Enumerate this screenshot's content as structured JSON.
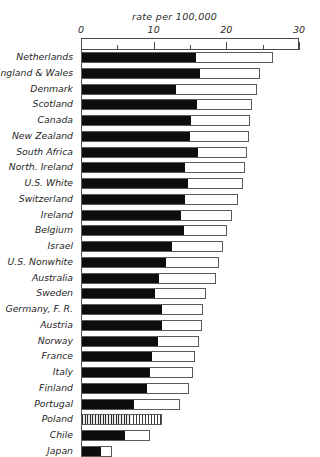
{
  "chart_data": {
    "type": "bar",
    "orientation": "horizontal",
    "title": "rate per 100,000",
    "xlabel": "",
    "ylabel": "",
    "xlim": [
      0,
      30
    ],
    "grid": false,
    "legend": null,
    "tick_labels": [
      "0",
      "10",
      "20",
      "30"
    ],
    "tick_values": [
      0,
      10,
      20,
      30
    ],
    "minor_tick_values": [
      5,
      15,
      25
    ],
    "categories": [
      "Netherlands",
      "England & Wales",
      "Denmark",
      "Scotland",
      "Canada",
      "New Zealand",
      "South Africa",
      "North. Ireland",
      "U.S. White",
      "Switzerland",
      "Ireland",
      "Belgium",
      "Israel",
      "U.S. Nonwhite",
      "Australia",
      "Sweden",
      "Germany, F. R.",
      "Austria",
      "Norway",
      "France",
      "Italy",
      "Finland",
      "Portugal",
      "Poland",
      "Chile",
      "Japan"
    ],
    "series": [
      {
        "name": "dark segment",
        "fill": "solid-black",
        "values": [
          15.7,
          16.3,
          13.0,
          15.8,
          15.0,
          14.9,
          16.0,
          14.2,
          14.6,
          14.2,
          13.6,
          14.1,
          12.4,
          11.6,
          10.6,
          10.1,
          11.0,
          11.0,
          10.5,
          9.6,
          9.3,
          9.0,
          7.2,
          6.8,
          5.9,
          2.6
        ]
      },
      {
        "name": "total (outer bar)",
        "fill": "open-white",
        "values": [
          26.4,
          24.6,
          24.2,
          23.5,
          23.3,
          23.1,
          22.9,
          22.6,
          22.3,
          21.6,
          20.8,
          20.1,
          19.5,
          19.0,
          18.6,
          17.2,
          16.8,
          16.6,
          16.3,
          15.7,
          15.4,
          14.9,
          13.6,
          11.1,
          9.5,
          4.3
        ]
      }
    ],
    "special_styles": {
      "Poland": "hatched"
    }
  }
}
